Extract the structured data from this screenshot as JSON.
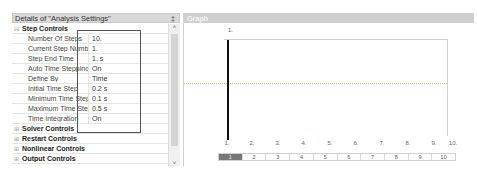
{
  "details": {
    "title": "Details of \"Analysis Settings\"",
    "pin_icon": "‡",
    "sections": [
      {
        "label": "Step Controls",
        "expanded": true,
        "expander": "⊟",
        "properties": [
          {
            "name": "Number Of Steps",
            "value": "10."
          },
          {
            "name": "Current Step Number",
            "value": "1."
          },
          {
            "name": "Step End Time",
            "value": "1. s"
          },
          {
            "name": "Auto Time Stepping",
            "value": "On"
          },
          {
            "name": "Define By",
            "value": "Time"
          },
          {
            "name": "Initial Time Step",
            "value": "0.2 s"
          },
          {
            "name": "Minimum Time Step",
            "value": "0.1 s"
          },
          {
            "name": "Maximum Time Step",
            "value": "0.5 s"
          },
          {
            "name": "Time Integration",
            "value": "On"
          }
        ]
      },
      {
        "label": "Solver Controls",
        "expanded": false,
        "expander": "⊞"
      },
      {
        "label": "Restart Controls",
        "expanded": false,
        "expander": "⊞"
      },
      {
        "label": "Nonlinear Controls",
        "expanded": false,
        "expander": "⊞"
      },
      {
        "label": "Output Controls",
        "expanded": false,
        "expander": "⊞"
      }
    ],
    "scroll_up": "˄",
    "scroll_down": "˅"
  },
  "graph": {
    "title": "Graph",
    "top_label": "1.",
    "x_ticks": [
      "1.",
      "2.",
      "3.",
      "4.",
      "5.",
      "6.",
      "7.",
      "8.",
      "9.",
      "10."
    ],
    "step_buttons": [
      "1",
      "2",
      "3",
      "4",
      "5",
      "6",
      "7",
      "8",
      "9",
      "10"
    ],
    "active_step": "1"
  }
}
